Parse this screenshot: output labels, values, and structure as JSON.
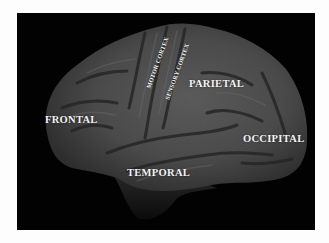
{
  "diagram": {
    "background_color": "#020202",
    "brain_color": "#4a4a4a",
    "label_color": "#f4f4f4",
    "labels": {
      "frontal": "FRONTAL",
      "motor_cortex": "MOTOR CORTEX",
      "sensory_cortex": "SENSORY CORTEX",
      "parietal": "PARIETAL",
      "occipital": "OCCIPITAL",
      "temporal": "TEMPORAL"
    }
  }
}
